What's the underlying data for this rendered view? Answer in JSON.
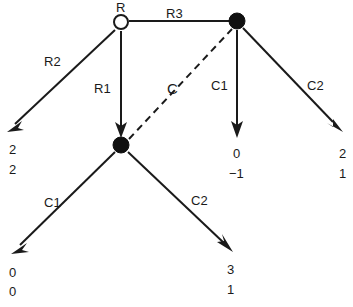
{
  "diagram": {
    "type": "extensive-form-game-tree",
    "nodes": [
      {
        "id": "root",
        "label": "R",
        "style": "hollow-circle",
        "x": 121,
        "y": 23,
        "r": 7
      },
      {
        "id": "n_mid",
        "label": "",
        "style": "filled-circle",
        "x": 121,
        "y": 145,
        "r": 7
      },
      {
        "id": "n_right",
        "label": "",
        "style": "filled-circle",
        "x": 237,
        "y": 22,
        "r": 7
      }
    ],
    "edges": [
      {
        "id": "e_r2",
        "label": "R2",
        "from": "root",
        "to": "leaf_a",
        "style": "solid",
        "arrow": true
      },
      {
        "id": "e_r1",
        "label": "R1",
        "from": "root",
        "to": "n_mid",
        "style": "solid",
        "arrow": true
      },
      {
        "id": "e_r3",
        "label": "R3",
        "from": "root",
        "to": "n_right",
        "style": "solid",
        "arrow": false
      },
      {
        "id": "e_c",
        "label": "C",
        "from": "n_mid",
        "to": "n_right",
        "style": "dashed",
        "arrow": false
      },
      {
        "id": "e_c1_right",
        "label": "C1",
        "from": "n_right",
        "to": "leaf_c",
        "style": "solid",
        "arrow": true
      },
      {
        "id": "e_c2_right",
        "label": "C2",
        "from": "n_right",
        "to": "leaf_d",
        "style": "solid",
        "arrow": true
      },
      {
        "id": "e_c1_mid",
        "label": "C1",
        "from": "n_mid",
        "to": "leaf_e",
        "style": "solid",
        "arrow": true
      },
      {
        "id": "e_c2_mid",
        "label": "C2",
        "from": "n_mid",
        "to": "leaf_f",
        "style": "solid",
        "arrow": true
      }
    ],
    "labels": {
      "root_node": "R",
      "edge_r1": "R1",
      "edge_r2": "R2",
      "edge_r3": "R3",
      "edge_c": "C",
      "edge_c1_right": "C1",
      "edge_c2_right": "C2",
      "edge_c1_mid": "C1",
      "edge_c2_mid": "C2"
    },
    "payoffs": [
      {
        "id": "leaf_a",
        "top": "2",
        "bottom": "2"
      },
      {
        "id": "leaf_c",
        "top": "0",
        "bottom": "−1"
      },
      {
        "id": "leaf_d",
        "top": "2",
        "bottom": "1"
      },
      {
        "id": "leaf_e",
        "top": "0",
        "bottom": "0"
      },
      {
        "id": "leaf_f",
        "top": "3",
        "bottom": "1"
      }
    ],
    "colors": {
      "stroke": "#1a1a1a",
      "node_fill": "#101010",
      "background": "#ffffff"
    }
  }
}
